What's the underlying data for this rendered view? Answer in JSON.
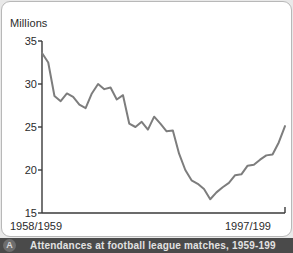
{
  "panel": {
    "background_color": "#ffffff",
    "border_color": "#b8b8b8"
  },
  "caption": {
    "badge_label": "A",
    "text": "Attendances at football league matches, 1959-199"
  },
  "chart_data": {
    "type": "line",
    "title": "",
    "subtitle": "",
    "xlabel": "",
    "ylabel": "Millions",
    "ylim": [
      15,
      35
    ],
    "yticks": [
      35,
      30,
      25,
      20,
      15
    ],
    "ytick_labels": [
      "35",
      "30",
      "25",
      "20",
      "15"
    ],
    "xtick_labels": [
      "1958/1959",
      "1997/199"
    ],
    "xlim_labels": [
      "1958/1959",
      "1997/199"
    ],
    "grid": false,
    "legend": null,
    "line_color": "#7d7d7d",
    "line_width": 2,
    "series": [
      {
        "name": "Attendances at football league matches",
        "units": "Millions",
        "x": [
          "1958/1959",
          "1959/1960",
          "1960/1961",
          "1961/1962",
          "1962/1963",
          "1963/1964",
          "1964/1965",
          "1965/1966",
          "1966/1967",
          "1967/1968",
          "1968/1969",
          "1969/1970",
          "1970/1971",
          "1971/1972",
          "1972/1973",
          "1973/1974",
          "1974/1975",
          "1975/1976",
          "1976/1977",
          "1977/1978",
          "1978/1979",
          "1979/1980",
          "1980/1981",
          "1981/1982",
          "1982/1983",
          "1983/1984",
          "1984/1985",
          "1985/1986",
          "1986/1987",
          "1987/1988",
          "1988/1989",
          "1989/1990",
          "1990/1991",
          "1991/1992",
          "1992/1993",
          "1993/1994",
          "1994/1995",
          "1995/1996",
          "1996/1997",
          "1997/1998"
        ],
        "values": [
          33.6,
          32.5,
          28.6,
          28.0,
          28.9,
          28.5,
          27.6,
          27.2,
          28.9,
          30.0,
          29.4,
          29.6,
          28.2,
          28.7,
          25.4,
          25.0,
          25.6,
          24.7,
          26.2,
          25.4,
          24.5,
          24.6,
          21.9,
          20.0,
          18.8,
          18.4,
          17.8,
          16.6,
          17.4,
          18.0,
          18.5,
          19.4,
          19.5,
          20.5,
          20.6,
          21.2,
          21.7,
          21.8,
          23.2,
          25.1
        ]
      }
    ]
  }
}
